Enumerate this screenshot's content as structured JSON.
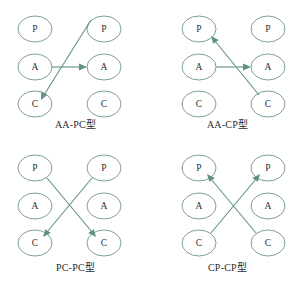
{
  "figure": {
    "background_color": "#ffffff",
    "node_stroke_color": "#7e9f97",
    "edge_color": "#5f9188",
    "label_color": "#2f2f2f"
  },
  "panels": [
    {
      "id": "aa-pc",
      "caption": "AA-PC型",
      "nodes": [
        {
          "label": "P",
          "column": "left",
          "row": "top"
        },
        {
          "label": "A",
          "column": "left",
          "row": "middle"
        },
        {
          "label": "C",
          "column": "left",
          "row": "bottom"
        },
        {
          "label": "P",
          "column": "right",
          "row": "top"
        },
        {
          "label": "A",
          "column": "right",
          "row": "middle"
        },
        {
          "label": "C",
          "column": "right",
          "row": "bottom"
        }
      ],
      "edges": [
        {
          "from": "left-A",
          "to": "right-A",
          "kind": "horizontal"
        },
        {
          "from": "right-P",
          "to": "left-C",
          "kind": "diagonal"
        }
      ]
    },
    {
      "id": "aa-cp",
      "caption": "AA-CP型",
      "nodes": [
        {
          "label": "P",
          "column": "left",
          "row": "top"
        },
        {
          "label": "A",
          "column": "left",
          "row": "middle"
        },
        {
          "label": "C",
          "column": "left",
          "row": "bottom"
        },
        {
          "label": "P",
          "column": "right",
          "row": "top"
        },
        {
          "label": "A",
          "column": "right",
          "row": "middle"
        },
        {
          "label": "C",
          "column": "right",
          "row": "bottom"
        }
      ],
      "edges": [
        {
          "from": "left-A",
          "to": "right-A",
          "kind": "horizontal"
        },
        {
          "from": "right-C",
          "to": "left-P",
          "kind": "diagonal"
        }
      ]
    },
    {
      "id": "pc-pc",
      "caption": "PC-PC型",
      "nodes": [
        {
          "label": "P",
          "column": "left",
          "row": "top"
        },
        {
          "label": "A",
          "column": "left",
          "row": "middle"
        },
        {
          "label": "C",
          "column": "left",
          "row": "bottom"
        },
        {
          "label": "P",
          "column": "right",
          "row": "top"
        },
        {
          "label": "A",
          "column": "right",
          "row": "middle"
        },
        {
          "label": "C",
          "column": "right",
          "row": "bottom"
        }
      ],
      "edges": [
        {
          "from": "left-P",
          "to": "right-C",
          "kind": "diagonal"
        },
        {
          "from": "right-P",
          "to": "left-C",
          "kind": "diagonal"
        }
      ]
    },
    {
      "id": "cp-cp",
      "caption": "CP-CP型",
      "nodes": [
        {
          "label": "P",
          "column": "left",
          "row": "top"
        },
        {
          "label": "A",
          "column": "left",
          "row": "middle"
        },
        {
          "label": "C",
          "column": "left",
          "row": "bottom"
        },
        {
          "label": "P",
          "column": "right",
          "row": "top"
        },
        {
          "label": "A",
          "column": "right",
          "row": "middle"
        },
        {
          "label": "C",
          "column": "right",
          "row": "bottom"
        }
      ],
      "edges": [
        {
          "from": "left-C",
          "to": "right-P",
          "kind": "diagonal"
        },
        {
          "from": "right-C",
          "to": "left-P",
          "kind": "diagonal"
        }
      ]
    }
  ]
}
